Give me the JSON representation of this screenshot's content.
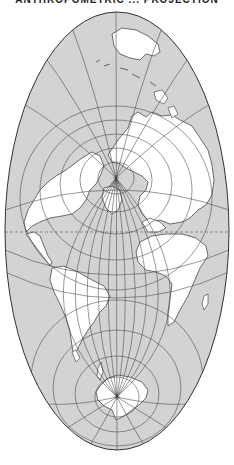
{
  "title": "ANTHROPOMETRIC ... PROJECTION",
  "caption": "",
  "map": {
    "projection_shape": "ellipse",
    "ellipse": {
      "cx": 117,
      "cy": 231,
      "rx": 112,
      "ry": 219
    },
    "north_pole": {
      "x": 116,
      "y": 178
    },
    "south_pole": {
      "x": 117,
      "y": 397
    },
    "equator_y": 232,
    "colors": {
      "ocean": "#d3d3d3",
      "land": "#ffffff",
      "outline": "#333333",
      "graticule": "#444444",
      "background": "#ffffff"
    },
    "features": [
      "graticule",
      "dashed-equator",
      "north-america",
      "south-america",
      "europe-asia",
      "africa",
      "greenland",
      "antarctica",
      "australia"
    ]
  }
}
